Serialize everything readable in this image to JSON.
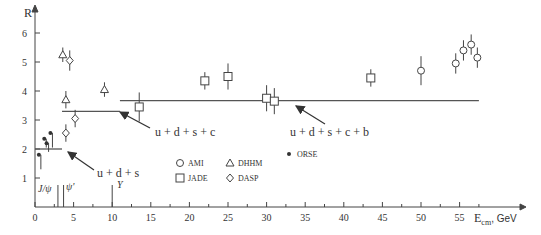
{
  "chart_data": {
    "type": "scatter",
    "title": "",
    "xlabel": "E_cm, GeV",
    "ylabel": "R",
    "xlim": [
      0,
      60
    ],
    "ylim": [
      0,
      6.5
    ],
    "x_ticks": [
      0,
      5,
      10,
      15,
      20,
      25,
      30,
      35,
      40,
      45,
      50,
      55
    ],
    "y_ticks": [
      1,
      2,
      3,
      4,
      5,
      6
    ],
    "grid": false,
    "series": [
      {
        "name": "ORSE",
        "marker": "dot",
        "points": [
          {
            "x": 0.5,
            "y": 1.8,
            "err": 0.5
          },
          {
            "x": 1.2,
            "y": 2.35,
            "err": 0.3
          },
          {
            "x": 1.5,
            "y": 2.2,
            "err": 0.3
          },
          {
            "x": 2.0,
            "y": 2.55,
            "err": 0.5
          }
        ]
      },
      {
        "name": "DHHM",
        "marker": "triangle",
        "points": [
          {
            "x": 3.6,
            "y": 5.25,
            "err": 0.25
          },
          {
            "x": 4.0,
            "y": 3.7,
            "err": 0.3
          },
          {
            "x": 9.0,
            "y": 4.05,
            "err": 0.25
          }
        ]
      },
      {
        "name": "DASP",
        "marker": "diamond",
        "points": [
          {
            "x": 4.5,
            "y": 5.05,
            "err": 0.35
          },
          {
            "x": 4.0,
            "y": 2.55,
            "err": 0.3
          },
          {
            "x": 5.2,
            "y": 3.05,
            "err": 0.3
          }
        ]
      },
      {
        "name": "JADE",
        "marker": "square",
        "points": [
          {
            "x": 13.5,
            "y": 3.45,
            "err": 0.5
          },
          {
            "x": 22.0,
            "y": 4.35,
            "err": 0.3
          },
          {
            "x": 25.0,
            "y": 4.5,
            "err": 0.45
          },
          {
            "x": 30.0,
            "y": 3.75,
            "err": 0.45
          },
          {
            "x": 31.0,
            "y": 3.65,
            "err": 0.45
          },
          {
            "x": 43.5,
            "y": 4.45,
            "err": 0.3
          }
        ]
      },
      {
        "name": "AMI",
        "marker": "circle-cross",
        "points": [
          {
            "x": 50.0,
            "y": 4.7,
            "err": 0.5
          },
          {
            "x": 54.5,
            "y": 4.95,
            "err": 0.35
          },
          {
            "x": 55.5,
            "y": 5.4,
            "err": 0.35
          },
          {
            "x": 56.5,
            "y": 5.6,
            "err": 0.35
          },
          {
            "x": 57.3,
            "y": 5.15,
            "err": 0.35
          }
        ]
      }
    ],
    "levels": [
      {
        "label": "u + d + s",
        "y": 2.0,
        "x_from": 0,
        "x_to": 3.5
      },
      {
        "label": "u + d + s + c",
        "y": 3.3,
        "x_from": 3.5,
        "x_to": 11.0
      },
      {
        "label": "u + d + s + c + b",
        "y": 3.67,
        "x_from": 11.0,
        "x_to": 57.5
      }
    ],
    "resonances": [
      {
        "label": "J/ψ",
        "x": 3.1
      },
      {
        "label": "ψ'",
        "x": 3.7
      },
      {
        "label": "Υ",
        "x": 10.0
      }
    ],
    "legend": {
      "position": "center-bottom",
      "entries": [
        "AMI",
        "DHHM",
        "JADE",
        "DASP",
        "ORSE"
      ]
    }
  },
  "labels": {
    "y_axis": "R",
    "x_axis_main": "E",
    "x_axis_sub": "cm",
    "x_axis_unit": ", GeV",
    "level1": "u + d + s",
    "level2": "u + d + s + c",
    "level3": "u + d + s + c + b",
    "jpsi": "J/ψ",
    "psiprime": "ψ'",
    "upsilon": "Υ",
    "legend_ami": "AMI",
    "legend_dhhm": "DHHM",
    "legend_jade": "JADE",
    "legend_dasp": "DASP",
    "legend_orse": "ORSE"
  }
}
